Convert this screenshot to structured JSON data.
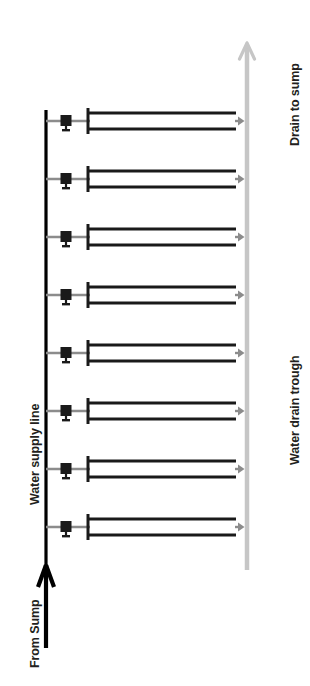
{
  "diagram": {
    "orientation": "rotated-90",
    "colors": {
      "pipe_black": "#1a1a1a",
      "supply_line_black": "#000000",
      "branch_gray": "#8c8c8c",
      "trough_gray": "#c6c6c6",
      "background": "#ffffff",
      "text": "#231f20"
    },
    "labels": {
      "drain_to_sump": "Drain to sump",
      "water_drain_trough": "Water drain trough",
      "water_supply_line": "Water supply line",
      "from_sump": "From Sump"
    },
    "supply_line": {
      "name": "Water supply line",
      "x": 46,
      "y_top": 110,
      "y_bottom": 612,
      "stroke_width": 3.2,
      "inlet_arrow": {
        "name": "from-sump-inlet-arrow",
        "direction": "up",
        "x": 46,
        "tip_y": 565,
        "tail_y": 648
      }
    },
    "drain_trough": {
      "name": "Water drain trough",
      "x": 247,
      "y_top": 47,
      "y_bottom": 570,
      "stroke_width": 4.5,
      "outlet_arrow": {
        "name": "drain-to-sump-arrow",
        "direction": "up",
        "tip_y": 43
      }
    },
    "branch_count": 8,
    "branches": [
      {
        "index": 1,
        "center_y": 121,
        "valve_x": 66,
        "riser_x": 88,
        "pipe_x_start": 88,
        "pipe_x_end": 236,
        "pipe_gap": 16,
        "drain_arrow_x": 238
      },
      {
        "index": 2,
        "center_y": 179,
        "valve_x": 66,
        "riser_x": 88,
        "pipe_x_start": 88,
        "pipe_x_end": 236,
        "pipe_gap": 16,
        "drain_arrow_x": 238
      },
      {
        "index": 3,
        "center_y": 237,
        "valve_x": 66,
        "riser_x": 88,
        "pipe_x_start": 88,
        "pipe_x_end": 236,
        "pipe_gap": 16,
        "drain_arrow_x": 238
      },
      {
        "index": 4,
        "center_y": 295,
        "valve_x": 66,
        "riser_x": 88,
        "pipe_x_start": 88,
        "pipe_x_end": 236,
        "pipe_gap": 16,
        "drain_arrow_x": 238
      },
      {
        "index": 5,
        "center_y": 353,
        "valve_x": 66,
        "riser_x": 88,
        "pipe_x_start": 88,
        "pipe_x_end": 236,
        "pipe_gap": 16,
        "drain_arrow_x": 238
      },
      {
        "index": 6,
        "center_y": 411,
        "valve_x": 66,
        "riser_x": 88,
        "pipe_x_start": 88,
        "pipe_x_end": 236,
        "pipe_gap": 16,
        "drain_arrow_x": 238
      },
      {
        "index": 7,
        "center_y": 469,
        "valve_x": 66,
        "riser_x": 88,
        "pipe_x_start": 88,
        "pipe_x_end": 236,
        "pipe_gap": 16,
        "drain_arrow_x": 238
      },
      {
        "index": 8,
        "center_y": 527,
        "valve_x": 66,
        "riser_x": 88,
        "pipe_x_start": 88,
        "pipe_x_end": 236,
        "pipe_gap": 16,
        "drain_arrow_x": 238
      }
    ]
  }
}
